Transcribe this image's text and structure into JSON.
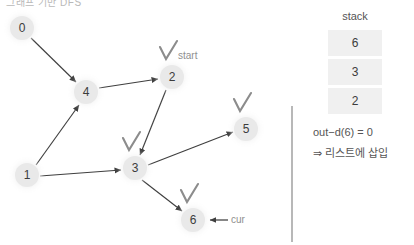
{
  "header": {
    "cut_off_text": "그래프 기반 DFS"
  },
  "graph": {
    "nodes": [
      {
        "id": "0",
        "label": "0",
        "x": 22,
        "y": 28,
        "visited": false,
        "annotation": ""
      },
      {
        "id": "4",
        "label": "4",
        "x": 86,
        "y": 92,
        "visited": false,
        "annotation": ""
      },
      {
        "id": "2",
        "label": "2",
        "x": 172,
        "y": 77,
        "visited": true,
        "annotation": "start"
      },
      {
        "id": "5",
        "label": "5",
        "x": 246,
        "y": 129,
        "visited": true,
        "annotation": ""
      },
      {
        "id": "1",
        "label": "1",
        "x": 27,
        "y": 175,
        "visited": false,
        "annotation": ""
      },
      {
        "id": "3",
        "label": "3",
        "x": 135,
        "y": 168,
        "visited": true,
        "annotation": ""
      },
      {
        "id": "6",
        "label": "6",
        "x": 193,
        "y": 220,
        "visited": true,
        "annotation": "cur"
      }
    ],
    "edges": [
      {
        "from": "0",
        "to": "4"
      },
      {
        "from": "1",
        "to": "4"
      },
      {
        "from": "4",
        "to": "2"
      },
      {
        "from": "2",
        "to": "3"
      },
      {
        "from": "1",
        "to": "3"
      },
      {
        "from": "3",
        "to": "5"
      },
      {
        "from": "3",
        "to": "6"
      }
    ],
    "start_label": "start",
    "cur_label": "cur"
  },
  "stack": {
    "title": "stack",
    "cells": [
      "6",
      "3",
      "2"
    ]
  },
  "notes": {
    "line1": "out−d(6) = 0",
    "line2": "⇒ 리스트에 삽입"
  },
  "colors": {
    "node_fill": "#e9e9e9",
    "node_text": "#3c3c3c",
    "edge": "#3f3f3f",
    "check": "#8c8c8c",
    "stack_cell": "#f0f0f0",
    "divider": "#9a9a9a",
    "label_text": "#8f8f8f"
  }
}
